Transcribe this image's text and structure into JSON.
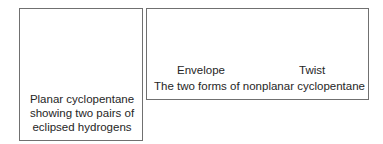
{
  "left_panel": {
    "atom_labels": [
      "H",
      "H",
      "H",
      "H"
    ],
    "caption_lines": [
      "Planar cyclopentane",
      "showing two pairs of",
      "eclipsed hydrogens"
    ]
  },
  "right_panel": {
    "forms": [
      {
        "label": "Envelope"
      },
      {
        "label": "Twist"
      }
    ],
    "caption": "The two forms of nonplanar cyclopentane"
  },
  "colors": {
    "line": "#3a3a3a",
    "border": "#707070",
    "text": "#262626"
  }
}
